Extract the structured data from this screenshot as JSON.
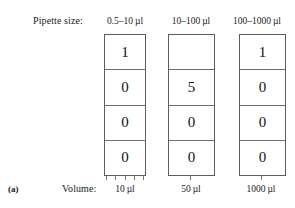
{
  "panel": {
    "label": "(a)"
  },
  "row_labels": {
    "pipette_size": "Pipette size:",
    "volume": "Volume:"
  },
  "columns": [
    {
      "header": "0.5–10 µl",
      "footer": "10 µl",
      "digits": [
        "1",
        "0",
        "0",
        "0"
      ]
    },
    {
      "header": "10–100 µl",
      "footer": "50 µl",
      "digits": [
        "",
        "5",
        "0",
        "0"
      ]
    },
    {
      "header": "100–1000 µl",
      "footer": "1000 µl",
      "digits": [
        "1",
        "0",
        "0",
        "0"
      ]
    }
  ]
}
